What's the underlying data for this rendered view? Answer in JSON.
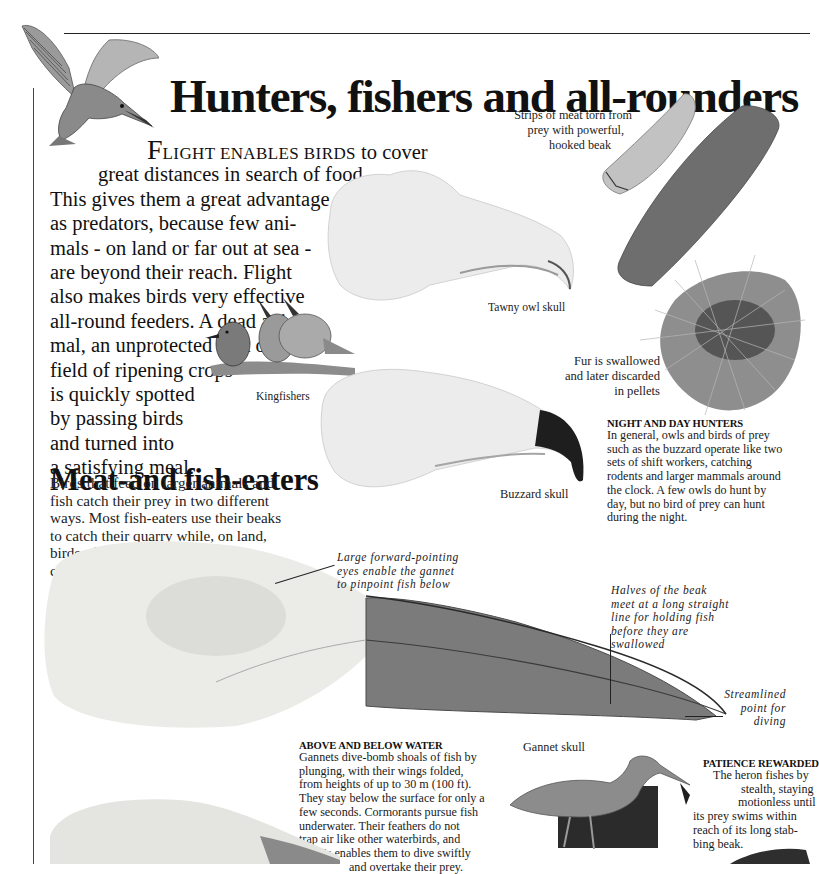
{
  "page": {
    "title": "Hunters, fishers and all-rounders",
    "intro": {
      "dropcap": "F",
      "smallcaps": "LIGHT ENABLES BIRDS",
      "first_line_rest": " to cover",
      "lines": [
        "great distances in search of food.",
        "This gives them a great advantage",
        "as predators, because few ani-",
        "mals - on land or far out at sea -",
        "are beyond their reach. Flight",
        "also makes birds very effective",
        "all-round feeders. A dead ani-",
        "mal, an unprotected nest or a",
        "field of ripening crops",
        "is quickly spotted",
        "by passing birds",
        "and turned into",
        "a satisfying meal."
      ]
    },
    "section": {
      "heading": "Meat-and fish-eaters",
      "body_lines": [
        "Birds that feed on larger animals and",
        "fish catch their prey in two different",
        "ways. Most fish-eaters use their beaks",
        "to catch their quarry while, on land,",
        "birds of prey use their talons for",
        "catching and their beaks for tearing."
      ]
    },
    "captions": {
      "kingfishers": "Kingfishers",
      "tawny_owl": "Tawny owl skull",
      "buzzard": "Buzzard skull",
      "gannet": "Gannet skull",
      "meat_strips": [
        "Strips of meat torn from",
        "prey with powerful,",
        "hooked beak"
      ],
      "fur": [
        "Fur is swallowed",
        "and later discarded",
        "in pellets"
      ],
      "eyes": [
        "Large forward-pointing",
        "eyes enable the gannet",
        "to pinpoint fish below"
      ],
      "beak_halves": [
        "Halves of the beak",
        "meet at a long straight",
        "line for holding fish",
        "before they are",
        "swallowed"
      ],
      "streamlined": [
        "Streamlined",
        "point for",
        "diving"
      ]
    },
    "boxes": {
      "night_day": {
        "heading": "NIGHT AND DAY HUNTERS",
        "lines": [
          "In general, owls and birds of prey",
          "such as the buzzard operate like two",
          "sets of shift workers, catching",
          "rodents and larger mammals around",
          "the clock. A few owls do hunt by",
          "day, but no bird of prey can hunt",
          "during the night."
        ]
      },
      "above_below": {
        "heading": "ABOVE AND BELOW WATER",
        "lines": [
          "Gannets dive-bomb shoals of fish by",
          "plunging, with their wings folded,",
          "from heights of up to 30 m (100 ft).",
          "They stay below the surface for only a",
          "few seconds. Cormorants pursue fish",
          "underwater. Their feathers do not",
          "trap air like other waterbirds, and",
          "this enables them to dive swiftly",
          "and overtake their prey."
        ]
      },
      "patience": {
        "heading": "PATIENCE REWARDED",
        "lines": [
          "The heron fishes by",
          "stealth, staying",
          "motionless until",
          "its prey swims within",
          "reach of its long stab-",
          "bing beak."
        ]
      }
    },
    "illustrations": {
      "kingfisher_flying": "kingfisher-in-flight",
      "kingfishers_perched": "three-kingfishers",
      "tawny_owl_skull": "tawny-owl-skull",
      "buzzard_skull": "buzzard-skull",
      "meat_strips": "meat-strips",
      "fur_pellet": "fur-pellet",
      "gannet_skull": "gannet-skull",
      "heron": "grey-heron",
      "lower_skull": "cormorant-skull"
    },
    "colors": {
      "text": "#1a1a1a",
      "bone": "#ecebe6",
      "beak_dark": "#2a2a2a",
      "meat": "#6e6e6e",
      "water": "#2b2b2b"
    }
  }
}
